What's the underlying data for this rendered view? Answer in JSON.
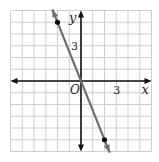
{
  "chart_data": {
    "type": "line",
    "title": "",
    "xlabel": "x",
    "ylabel": "y",
    "origin_label": "O",
    "xlim": [
      -6,
      6
    ],
    "ylim": [
      -6,
      6
    ],
    "grid": true,
    "x_tick_labels": [
      {
        "value": 3,
        "label": "3"
      }
    ],
    "y_tick_labels": [
      {
        "value": 3,
        "label": "3"
      }
    ],
    "series": [
      {
        "name": "y = -5/2 x",
        "equation": "y = -2.5x",
        "slope": -2.5,
        "intercept": 0,
        "points": [
          [
            -2,
            5
          ],
          [
            2,
            -5
          ]
        ],
        "color": "#6e6e6e"
      }
    ]
  },
  "colors": {
    "grid": "#cfcfcf",
    "axes": "#111111",
    "line": "#6e6e6e",
    "point": "#111111"
  }
}
